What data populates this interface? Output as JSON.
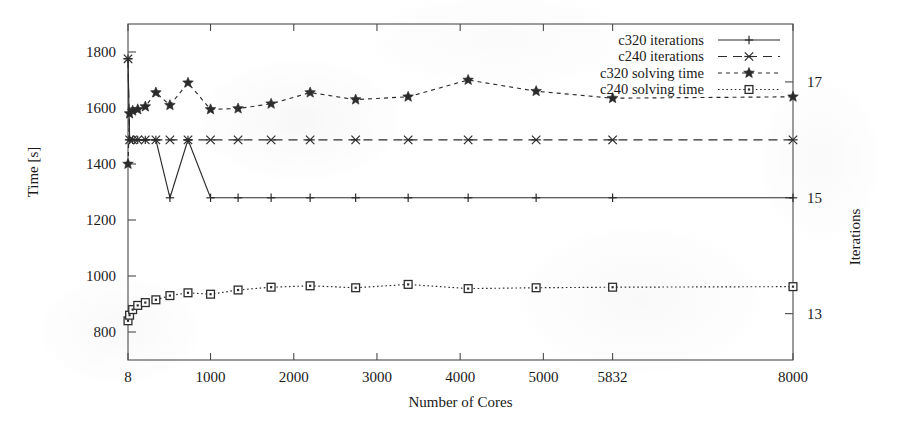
{
  "chart_data": {
    "type": "line",
    "title": "",
    "xlabel": "Number of Cores",
    "ylabel": "Time [s]",
    "y2label": "Iterations",
    "xlim": [
      8,
      8000
    ],
    "ylim": [
      700,
      1900
    ],
    "y2lim": [
      12.2,
      18.0
    ],
    "xticks": [
      8,
      1000,
      2000,
      3000,
      4000,
      5000,
      5832,
      8000
    ],
    "xticklabels": [
      "8",
      "1000",
      "2000",
      "3000",
      "4000",
      "5000",
      "5832",
      "8000"
    ],
    "yticks": [
      800,
      1000,
      1200,
      1400,
      1600,
      1800
    ],
    "yticklabels": [
      "800",
      "1000",
      "1200",
      "1400",
      "1600",
      "1800"
    ],
    "y2ticks": [
      13,
      15,
      17
    ],
    "y2ticklabels": [
      "13",
      "15",
      "17"
    ],
    "grid": false,
    "legend_position": "top-right",
    "series": [
      {
        "name": "c320 iterations",
        "axis": "right",
        "style": "solid",
        "marker": "plus",
        "x": [
          8,
          27,
          64,
          125,
          216,
          343,
          512,
          729,
          1000,
          1331,
          1728,
          2197,
          2744,
          3375,
          4096,
          4913,
          5832,
          8000
        ],
        "values": [
          17.4,
          16.0,
          16.0,
          16.0,
          16.0,
          16.0,
          15.0,
          16.0,
          15.0,
          15.0,
          15.0,
          15.0,
          15.0,
          15.0,
          15.0,
          15.0,
          15.0,
          15.0
        ]
      },
      {
        "name": "c240 iterations",
        "axis": "right",
        "style": "dashed",
        "marker": "asterisk",
        "x": [
          8,
          27,
          64,
          125,
          216,
          343,
          512,
          729,
          1000,
          1331,
          1728,
          2197,
          2744,
          3375,
          4096,
          4913,
          5832,
          8000
        ],
        "values": [
          17.4,
          16.0,
          16.0,
          16.0,
          16.0,
          16.0,
          16.0,
          16.0,
          16.0,
          16.0,
          16.0,
          16.0,
          16.0,
          16.0,
          16.0,
          16.0,
          16.0,
          16.0
        ]
      },
      {
        "name": "c320 solving time",
        "axis": "left",
        "style": "dotted-dash",
        "marker": "star",
        "x": [
          8,
          27,
          64,
          125,
          216,
          343,
          512,
          729,
          1000,
          1331,
          1728,
          2197,
          2744,
          3375,
          4096,
          4913,
          5832,
          8000
        ],
        "values": [
          1400,
          1580,
          1590,
          1595,
          1605,
          1655,
          1610,
          1690,
          1595,
          1598,
          1615,
          1655,
          1630,
          1640,
          1700,
          1660,
          1635,
          1640
        ]
      },
      {
        "name": "c240 solving time",
        "axis": "left",
        "style": "fine-dotted",
        "marker": "square",
        "x": [
          8,
          27,
          64,
          125,
          216,
          343,
          512,
          729,
          1000,
          1331,
          1728,
          2197,
          2744,
          3375,
          4096,
          4913,
          5832,
          8000
        ],
        "values": [
          840,
          860,
          880,
          895,
          905,
          915,
          930,
          940,
          935,
          950,
          960,
          965,
          958,
          970,
          955,
          958,
          960,
          962
        ]
      }
    ]
  },
  "legend": {
    "items": [
      {
        "label": "c320 iterations"
      },
      {
        "label": "c240 iterations"
      },
      {
        "label": "c320 solving time"
      },
      {
        "label": "c240 solving time"
      }
    ]
  },
  "colors": {
    "axis": "#4a4a4a",
    "text": "#1a1a1a",
    "series": "#2b2b2b",
    "background": "#ffffff"
  }
}
